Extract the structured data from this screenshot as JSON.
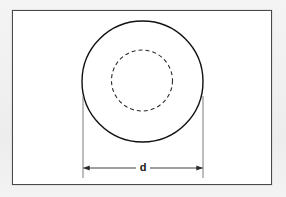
{
  "figure": {
    "background_color": "#f2f2f2",
    "panel_color": "#ffffff",
    "frame": {
      "name": "figure-border",
      "stroke_color": "#4a4a4a",
      "stroke_width": 1,
      "x": 12,
      "y": 10,
      "width": 260,
      "height": 175
    },
    "shapes": {
      "outer_circle": {
        "name": "outer-circle",
        "style": "solid",
        "stroke_color": "#111111",
        "stroke_width": 1.4,
        "fill": "none",
        "cx": 142.5,
        "cy": 81.5,
        "r": 60.5
      },
      "inner_circle": {
        "name": "hidden-inner-circle",
        "style": "dashed",
        "stroke_color": "#2b2b2b",
        "stroke_width": 1.1,
        "dash_pattern": "4 3",
        "fill": "none",
        "cx": 142,
        "cy": 80.5,
        "r": 30.5
      }
    },
    "dimension": {
      "name": "diameter-dimension",
      "label": "d",
      "label_x": 143,
      "label_y": 167,
      "line_y": 168,
      "line_x1": 83,
      "line_x2": 203,
      "stroke_color": "#2b2b2b",
      "stroke_width": 0.9,
      "arrowheads": "both",
      "extension_lines": [
        {
          "name": "extension-line-left",
          "x": 83,
          "y1": 96,
          "y2": 178
        },
        {
          "name": "extension-line-right",
          "x": 203,
          "y1": 96,
          "y2": 178
        }
      ]
    }
  }
}
